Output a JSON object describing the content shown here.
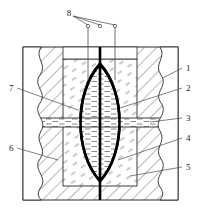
{
  "figure": {
    "type": "patent-line-drawing",
    "background_color": "#ffffff",
    "line_color": "#2b2b2b",
    "heavy_line_color": "#000000",
    "hatch_color": "#555555",
    "width": 200,
    "height": 208
  },
  "callouts": [
    {
      "id": "8",
      "label": "8",
      "x": 69,
      "y": 13,
      "leader_targets": "three-probe-tops"
    },
    {
      "id": "1",
      "label": "1",
      "x": 186,
      "y": 69,
      "leader_targets": "outer-body-right"
    },
    {
      "id": "2",
      "label": "2",
      "x": 186,
      "y": 89,
      "leader_targets": "inner-block-right"
    },
    {
      "id": "3",
      "label": "3",
      "x": 186,
      "y": 119,
      "leader_targets": "mid-channel-right"
    },
    {
      "id": "4",
      "label": "4",
      "x": 186,
      "y": 139,
      "leader_targets": "lens-lower-right"
    },
    {
      "id": "5",
      "label": "5",
      "x": 186,
      "y": 168,
      "leader_targets": "lower-inner-block"
    },
    {
      "id": "6",
      "label": "6",
      "x": 11,
      "y": 149,
      "leader_targets": "outer-body-left"
    },
    {
      "id": "7",
      "label": "7",
      "x": 11,
      "y": 89,
      "leader_targets": "lens-upper-left"
    }
  ],
  "probes": {
    "count": 3,
    "tip_marker": "small-circle",
    "x_positions": [
      88,
      100,
      115
    ],
    "circle_y": 27,
    "descend_to_y": 80
  },
  "geometry": {
    "outer_body": {
      "x": 23,
      "y": 47,
      "w": 155,
      "h": 153
    },
    "inner_block": {
      "x": 63,
      "y": 59,
      "w": 74,
      "h": 127
    },
    "lens": {
      "cx": 100,
      "top_y": 64,
      "bottom_y": 181,
      "half_width": 34
    },
    "mid_channel": {
      "y": 118,
      "h": 9
    },
    "center_axis_x": 100
  },
  "hatching": {
    "outer_body_style": "diagonal-45",
    "inner_block_style": "sparse-dashes",
    "fluid_style": "horizontal-dashes"
  }
}
